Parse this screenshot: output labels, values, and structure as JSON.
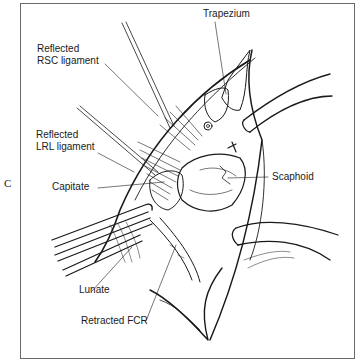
{
  "figure": {
    "panel_letter": "C",
    "labels": [
      {
        "id": "rsc",
        "line1": "Reflected",
        "line2": "RSC ligament"
      },
      {
        "id": "lrl",
        "line1": "Reflected",
        "line2": "LRL ligament"
      },
      {
        "id": "capitate",
        "text": "Capitate"
      },
      {
        "id": "lunate",
        "text": "Lunate"
      },
      {
        "id": "retracted_fcr",
        "text": "Retracted FCR"
      },
      {
        "id": "trapezium",
        "text": "Trapezium"
      },
      {
        "id": "scaphoid",
        "text": "Scaphoid"
      }
    ],
    "colors": {
      "ink": "#1a1a1a",
      "frame": "#6a6a6a",
      "background": "#ffffff"
    }
  }
}
